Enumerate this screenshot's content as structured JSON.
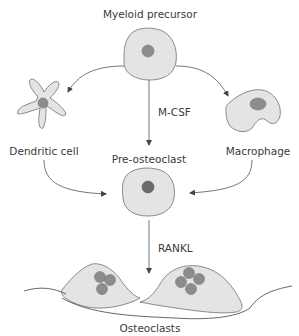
{
  "diagram": {
    "nodes": {
      "myeloid_precursor": "Myeloid precursor",
      "dendritic_cell": "Dendritic cell",
      "macrophage": "Macrophage",
      "pre_osteoclast": "Pre-osteoclast",
      "osteoclasts": "Osteoclasts"
    },
    "factors": {
      "mcsf": "M-CSF",
      "rankl": "RANKL"
    },
    "edges": [
      {
        "from": "Myeloid precursor",
        "to": "Dendritic cell"
      },
      {
        "from": "Myeloid precursor",
        "to": "Macrophage"
      },
      {
        "from": "Myeloid precursor",
        "to": "Pre-osteoclast",
        "label": "M-CSF"
      },
      {
        "from": "Dendritic cell",
        "to": "Pre-osteoclast"
      },
      {
        "from": "Macrophage",
        "to": "Pre-osteoclast"
      },
      {
        "from": "Pre-osteoclast",
        "to": "Osteoclasts",
        "label": "RANKL"
      }
    ],
    "colors": {
      "cell_fill": "#e4e4e4",
      "cell_stroke": "#8a8a8a",
      "nucleus": "#8c8c8c",
      "text": "#3a3a3a"
    }
  }
}
